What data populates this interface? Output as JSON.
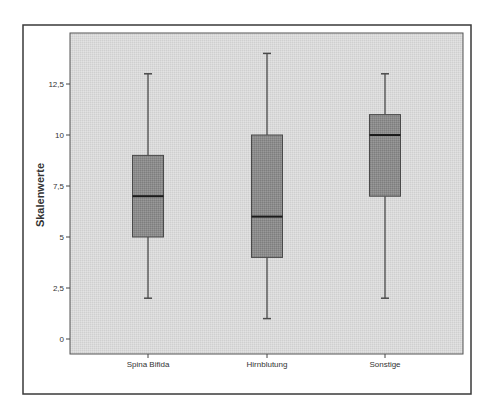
{
  "chart_data": {
    "type": "boxplot",
    "title": "",
    "xlabel": "",
    "ylabel": "Skalenwerte",
    "ylim": [
      -0.75,
      15
    ],
    "y_ticks": [
      0,
      2.5,
      5,
      7.5,
      10,
      12.5
    ],
    "y_tick_labels": [
      "0",
      "2,5",
      "5",
      "7,5",
      "10",
      "12,5"
    ],
    "categories": [
      "Spina Bifida",
      "Hirnblutung",
      "Sonstige"
    ],
    "series": [
      {
        "name": "Spina Bifida",
        "min": 2,
        "q1": 5,
        "median": 7,
        "q3": 9,
        "max": 13
      },
      {
        "name": "Hirnblutung",
        "min": 1,
        "q1": 4,
        "median": 6,
        "q3": 10,
        "max": 14
      },
      {
        "name": "Sonstige",
        "min": 2,
        "q1": 7,
        "median": 10,
        "q3": 11,
        "max": 13
      }
    ],
    "grid": false,
    "legend": "none"
  },
  "style": {
    "plot_background": "#d9d9d9",
    "box_fill": "#8c8c8c",
    "box_stroke": "#4a4a4a",
    "median_color": "#1a1a1a",
    "frame_color": "#3a3a3a",
    "text_color": "#333333"
  }
}
